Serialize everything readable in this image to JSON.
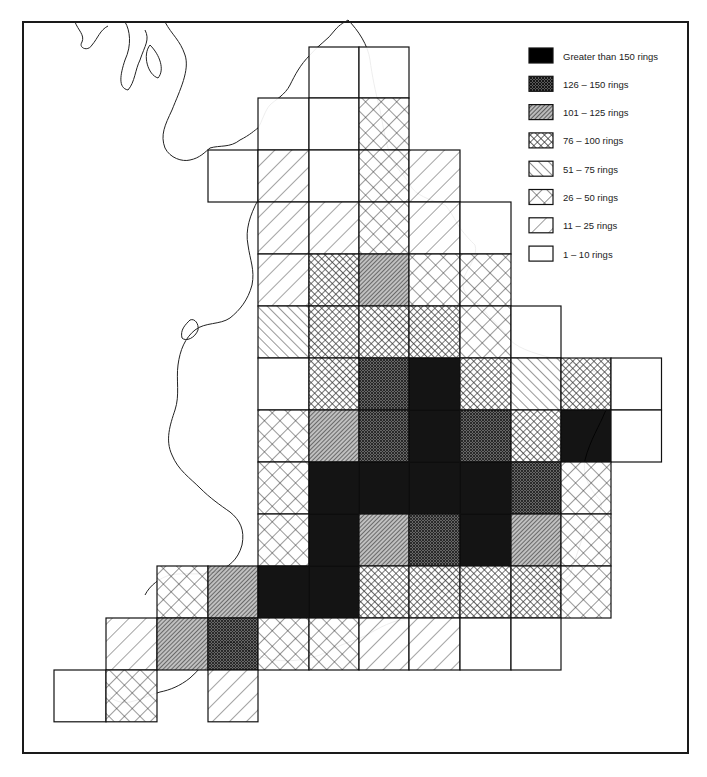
{
  "map": {
    "title": "",
    "legend": [
      {
        "key": "gt150",
        "label": "Greater than 150 rings",
        "pattern": "solid-black"
      },
      {
        "key": "126-150",
        "label": "126 – 150 rings",
        "pattern": "dense-crosshatch-dark"
      },
      {
        "key": "101-125",
        "label": "101 – 125 rings",
        "pattern": "dense-diagonal"
      },
      {
        "key": "76-100",
        "label": "76 – 100 rings",
        "pattern": "medium-crosshatch"
      },
      {
        "key": "51-75",
        "label": "51 – 75 rings",
        "pattern": "back-diagonal"
      },
      {
        "key": "26-50",
        "label": "26 – 50 rings",
        "pattern": "open-crosshatch"
      },
      {
        "key": "11-25",
        "label": "11 – 25 rings",
        "pattern": "sparse-diagonal"
      },
      {
        "key": "1-10",
        "label": "1 – 10 rings",
        "pattern": "blank"
      }
    ],
    "grid": {
      "col_x": [
        54,
        106,
        157,
        208,
        258,
        309,
        359,
        409,
        460,
        511,
        561,
        611
      ],
      "row_y": [
        47,
        98,
        150,
        202,
        254,
        306,
        358,
        410,
        462,
        514,
        566,
        618,
        670
      ],
      "cell_w": 50.5,
      "cell_h": 51.8,
      "cells": [
        {
          "r": 0,
          "c": 5,
          "cat": "1-10"
        },
        {
          "r": 0,
          "c": 6,
          "cat": "1-10"
        },
        {
          "r": 1,
          "c": 4,
          "cat": "1-10"
        },
        {
          "r": 1,
          "c": 5,
          "cat": "1-10"
        },
        {
          "r": 1,
          "c": 6,
          "cat": "26-50"
        },
        {
          "r": 2,
          "c": 3,
          "cat": "1-10"
        },
        {
          "r": 2,
          "c": 4,
          "cat": "11-25"
        },
        {
          "r": 2,
          "c": 5,
          "cat": "1-10"
        },
        {
          "r": 2,
          "c": 6,
          "cat": "26-50"
        },
        {
          "r": 2,
          "c": 7,
          "cat": "11-25"
        },
        {
          "r": 3,
          "c": 4,
          "cat": "11-25"
        },
        {
          "r": 3,
          "c": 5,
          "cat": "11-25"
        },
        {
          "r": 3,
          "c": 6,
          "cat": "26-50"
        },
        {
          "r": 3,
          "c": 7,
          "cat": "11-25"
        },
        {
          "r": 3,
          "c": 8,
          "cat": "1-10"
        },
        {
          "r": 4,
          "c": 4,
          "cat": "11-25"
        },
        {
          "r": 4,
          "c": 5,
          "cat": "76-100"
        },
        {
          "r": 4,
          "c": 6,
          "cat": "101-125"
        },
        {
          "r": 4,
          "c": 7,
          "cat": "26-50"
        },
        {
          "r": 4,
          "c": 8,
          "cat": "26-50"
        },
        {
          "r": 5,
          "c": 4,
          "cat": "51-75"
        },
        {
          "r": 5,
          "c": 5,
          "cat": "76-100"
        },
        {
          "r": 5,
          "c": 6,
          "cat": "76-100"
        },
        {
          "r": 5,
          "c": 7,
          "cat": "76-100"
        },
        {
          "r": 5,
          "c": 8,
          "cat": "26-50"
        },
        {
          "r": 5,
          "c": 9,
          "cat": "1-10"
        },
        {
          "r": 6,
          "c": 4,
          "cat": "1-10"
        },
        {
          "r": 6,
          "c": 5,
          "cat": "76-100"
        },
        {
          "r": 6,
          "c": 6,
          "cat": "126-150"
        },
        {
          "r": 6,
          "c": 7,
          "cat": "gt150"
        },
        {
          "r": 6,
          "c": 8,
          "cat": "76-100"
        },
        {
          "r": 6,
          "c": 9,
          "cat": "51-75"
        },
        {
          "r": 6,
          "c": 10,
          "cat": "76-100"
        },
        {
          "r": 6,
          "c": 11,
          "cat": "1-10"
        },
        {
          "r": 7,
          "c": 4,
          "cat": "26-50"
        },
        {
          "r": 7,
          "c": 5,
          "cat": "101-125"
        },
        {
          "r": 7,
          "c": 6,
          "cat": "126-150"
        },
        {
          "r": 7,
          "c": 7,
          "cat": "gt150"
        },
        {
          "r": 7,
          "c": 8,
          "cat": "126-150"
        },
        {
          "r": 7,
          "c": 9,
          "cat": "76-100"
        },
        {
          "r": 7,
          "c": 10,
          "cat": "gt150"
        },
        {
          "r": 7,
          "c": 11,
          "cat": "1-10"
        },
        {
          "r": 8,
          "c": 4,
          "cat": "26-50"
        },
        {
          "r": 8,
          "c": 5,
          "cat": "gt150"
        },
        {
          "r": 8,
          "c": 6,
          "cat": "gt150"
        },
        {
          "r": 8,
          "c": 7,
          "cat": "gt150"
        },
        {
          "r": 8,
          "c": 8,
          "cat": "gt150"
        },
        {
          "r": 8,
          "c": 9,
          "cat": "126-150"
        },
        {
          "r": 8,
          "c": 10,
          "cat": "26-50"
        },
        {
          "r": 9,
          "c": 4,
          "cat": "26-50"
        },
        {
          "r": 9,
          "c": 5,
          "cat": "gt150"
        },
        {
          "r": 9,
          "c": 6,
          "cat": "101-125"
        },
        {
          "r": 9,
          "c": 7,
          "cat": "126-150"
        },
        {
          "r": 9,
          "c": 8,
          "cat": "gt150"
        },
        {
          "r": 9,
          "c": 9,
          "cat": "101-125"
        },
        {
          "r": 9,
          "c": 10,
          "cat": "26-50"
        },
        {
          "r": 10,
          "c": 2,
          "cat": "26-50"
        },
        {
          "r": 10,
          "c": 3,
          "cat": "101-125"
        },
        {
          "r": 10,
          "c": 4,
          "cat": "gt150"
        },
        {
          "r": 10,
          "c": 5,
          "cat": "gt150"
        },
        {
          "r": 10,
          "c": 6,
          "cat": "76-100"
        },
        {
          "r": 10,
          "c": 7,
          "cat": "76-100"
        },
        {
          "r": 10,
          "c": 8,
          "cat": "76-100"
        },
        {
          "r": 10,
          "c": 9,
          "cat": "76-100"
        },
        {
          "r": 10,
          "c": 10,
          "cat": "26-50"
        },
        {
          "r": 11,
          "c": 1,
          "cat": "11-25"
        },
        {
          "r": 11,
          "c": 2,
          "cat": "101-125"
        },
        {
          "r": 11,
          "c": 3,
          "cat": "126-150"
        },
        {
          "r": 11,
          "c": 4,
          "cat": "26-50"
        },
        {
          "r": 11,
          "c": 5,
          "cat": "26-50"
        },
        {
          "r": 11,
          "c": 6,
          "cat": "11-25"
        },
        {
          "r": 11,
          "c": 7,
          "cat": "11-25"
        },
        {
          "r": 11,
          "c": 8,
          "cat": "1-10"
        },
        {
          "r": 11,
          "c": 9,
          "cat": "1-10"
        },
        {
          "r": 12,
          "c": 0,
          "cat": "1-10"
        },
        {
          "r": 12,
          "c": 1,
          "cat": "26-50"
        },
        {
          "r": 12,
          "c": 3,
          "cat": "11-25"
        }
      ]
    }
  }
}
